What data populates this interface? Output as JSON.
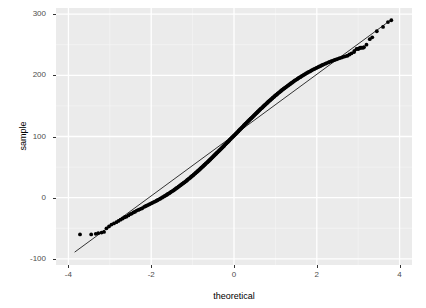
{
  "axes": {
    "x_title": "theoretical",
    "y_title": "sample",
    "x_ticks": [
      {
        "label": "-4",
        "value": -4
      },
      {
        "label": "-2",
        "value": -2
      },
      {
        "label": "0",
        "value": 0
      },
      {
        "label": "2",
        "value": 2
      },
      {
        "label": "4",
        "value": 4
      }
    ],
    "y_ticks": [
      {
        "label": "-100",
        "value": -100
      },
      {
        "label": "0",
        "value": 0
      },
      {
        "label": "100",
        "value": 100
      },
      {
        "label": "200",
        "value": 200
      },
      {
        "label": "300",
        "value": 300
      }
    ]
  },
  "style": {
    "panel_background": "#ebebeb",
    "grid_major": "#ffffff",
    "grid_minor": "#f5f5f5",
    "point_color": "#000000",
    "line_color": "#333333",
    "tick_text_color": "#4d4d4d",
    "title_color": "#000000"
  },
  "chart_data": {
    "type": "scatter",
    "title": "",
    "subtitle": "",
    "xlabel": "theoretical",
    "ylabel": "sample",
    "xlim": [
      -4.3,
      4.3
    ],
    "ylim": [
      -110,
      310
    ],
    "grid": true,
    "legend": false,
    "legend_position": "none",
    "xticks": [
      -4,
      -2,
      0,
      2,
      4
    ],
    "yticks": [
      -100,
      0,
      100,
      200,
      300
    ],
    "x_minor_ticks": [
      -3,
      -1,
      1,
      3
    ],
    "y_minor_ticks": [
      -50,
      50,
      150,
      250
    ],
    "reference_line": {
      "name": "qq-reference-line",
      "x0": -3.85,
      "y0": -89,
      "x1": 3.82,
      "y1": 292,
      "slope": 49.7,
      "intercept": 102.3
    },
    "series": [
      {
        "name": "sample quantiles",
        "marker": "filled-circle",
        "color": "#000000",
        "points": [
          [
            -3.72,
            -60
          ],
          [
            -3.45,
            -60
          ],
          [
            -3.34,
            -59
          ],
          [
            -3.28,
            -58
          ],
          [
            -3.2,
            -57
          ],
          [
            -3.14,
            -56
          ],
          [
            -3.08,
            -50
          ],
          [
            -3.02,
            -47
          ],
          [
            -2.96,
            -44
          ],
          [
            -2.9,
            -42
          ],
          [
            -2.84,
            -40
          ],
          [
            -2.79,
            -38
          ],
          [
            -2.74,
            -36
          ],
          [
            -2.69,
            -34
          ],
          [
            -2.64,
            -32
          ],
          [
            -2.6,
            -31
          ],
          [
            -2.55,
            -29
          ],
          [
            -2.51,
            -27
          ],
          [
            -2.47,
            -26
          ],
          [
            -2.43,
            -24
          ],
          [
            -2.39,
            -23
          ],
          [
            -2.35,
            -21
          ],
          [
            -2.31,
            -20
          ],
          [
            -2.28,
            -19
          ],
          [
            -2.24,
            -18
          ],
          [
            -2.21,
            -17
          ],
          [
            -2.17,
            -15
          ],
          [
            -2.14,
            -14
          ],
          [
            -2.11,
            -13
          ],
          [
            -2.08,
            -12
          ],
          [
            -2.05,
            -11
          ],
          [
            -2.02,
            -10
          ],
          [
            -1.99,
            -9
          ],
          [
            -1.96,
            -8
          ],
          [
            -1.93,
            -7
          ],
          [
            -1.9,
            -6
          ],
          [
            -1.87,
            -5
          ],
          [
            -1.85,
            -4
          ],
          [
            -1.82,
            -3
          ],
          [
            -1.79,
            -2
          ],
          [
            -1.77,
            -1
          ],
          [
            -1.74,
            0
          ],
          [
            -1.72,
            1
          ],
          [
            -1.69,
            2
          ],
          [
            -1.67,
            3
          ],
          [
            -1.64,
            4
          ],
          [
            -1.62,
            5
          ],
          [
            -1.6,
            6
          ],
          [
            -1.57,
            7
          ],
          [
            -1.55,
            8
          ],
          [
            -1.53,
            9
          ],
          [
            -1.51,
            10
          ],
          [
            -1.48,
            11
          ],
          [
            -1.46,
            12
          ],
          [
            -1.44,
            13
          ],
          [
            -1.42,
            14
          ],
          [
            -1.4,
            15
          ],
          [
            -1.38,
            16
          ],
          [
            -1.36,
            17
          ],
          [
            -1.34,
            18
          ],
          [
            -1.32,
            19
          ],
          [
            -1.3,
            20
          ],
          [
            -1.28,
            21
          ],
          [
            -1.26,
            22
          ],
          [
            -1.24,
            23
          ],
          [
            -1.22,
            24
          ],
          [
            -1.2,
            25
          ],
          [
            -1.18,
            26
          ],
          [
            -1.16,
            27
          ],
          [
            -1.14,
            28
          ],
          [
            -1.13,
            29
          ],
          [
            -1.11,
            30
          ],
          [
            -1.09,
            31
          ],
          [
            -1.07,
            32
          ],
          [
            -1.05,
            33
          ],
          [
            -1.04,
            34
          ],
          [
            -1.02,
            35
          ],
          [
            -1.0,
            36
          ],
          [
            -0.98,
            37
          ],
          [
            -0.97,
            38
          ],
          [
            -0.95,
            39
          ],
          [
            -0.93,
            40
          ],
          [
            -0.92,
            41
          ],
          [
            -0.9,
            42
          ],
          [
            -0.88,
            43
          ],
          [
            -0.87,
            44
          ],
          [
            -0.85,
            45
          ],
          [
            -0.83,
            46
          ],
          [
            -0.82,
            47
          ],
          [
            -0.8,
            48
          ],
          [
            -0.79,
            49
          ],
          [
            -0.77,
            50
          ],
          [
            -0.75,
            51
          ],
          [
            -0.74,
            52
          ],
          [
            -0.72,
            53
          ],
          [
            -0.71,
            54
          ],
          [
            -0.69,
            55
          ],
          [
            -0.68,
            56
          ],
          [
            -0.66,
            57
          ],
          [
            -0.64,
            58
          ],
          [
            -0.63,
            59
          ],
          [
            -0.61,
            60
          ],
          [
            -0.6,
            61
          ],
          [
            -0.58,
            62
          ],
          [
            -0.57,
            63
          ],
          [
            -0.55,
            64
          ],
          [
            -0.54,
            65
          ],
          [
            -0.52,
            66
          ],
          [
            -0.51,
            67
          ],
          [
            -0.49,
            68
          ],
          [
            -0.48,
            69
          ],
          [
            -0.46,
            70
          ],
          [
            -0.45,
            71
          ],
          [
            -0.43,
            72
          ],
          [
            -0.42,
            73
          ],
          [
            -0.4,
            74
          ],
          [
            -0.39,
            75
          ],
          [
            -0.37,
            76
          ],
          [
            -0.36,
            77
          ],
          [
            -0.34,
            78
          ],
          [
            -0.33,
            79
          ],
          [
            -0.31,
            80
          ],
          [
            -0.3,
            81
          ],
          [
            -0.28,
            82
          ],
          [
            -0.27,
            83
          ],
          [
            -0.25,
            84
          ],
          [
            -0.24,
            85
          ],
          [
            -0.23,
            86
          ],
          [
            -0.21,
            87
          ],
          [
            -0.2,
            88
          ],
          [
            -0.18,
            89
          ],
          [
            -0.17,
            90
          ],
          [
            -0.15,
            91
          ],
          [
            -0.14,
            92
          ],
          [
            -0.12,
            93
          ],
          [
            -0.11,
            94
          ],
          [
            -0.1,
            95
          ],
          [
            -0.08,
            96
          ],
          [
            -0.07,
            97
          ],
          [
            -0.05,
            98
          ],
          [
            -0.04,
            99
          ],
          [
            -0.02,
            100
          ],
          [
            -0.01,
            101
          ],
          [
            0.01,
            102
          ],
          [
            0.02,
            103
          ],
          [
            0.04,
            104
          ],
          [
            0.05,
            105
          ],
          [
            0.07,
            106
          ],
          [
            0.08,
            107
          ],
          [
            0.1,
            108
          ],
          [
            0.11,
            109
          ],
          [
            0.12,
            110
          ],
          [
            0.14,
            111
          ],
          [
            0.15,
            112
          ],
          [
            0.17,
            113
          ],
          [
            0.18,
            114
          ],
          [
            0.2,
            115
          ],
          [
            0.21,
            116
          ],
          [
            0.23,
            117
          ],
          [
            0.24,
            118
          ],
          [
            0.25,
            119
          ],
          [
            0.27,
            120
          ],
          [
            0.28,
            121
          ],
          [
            0.3,
            122
          ],
          [
            0.31,
            123
          ],
          [
            0.33,
            124
          ],
          [
            0.34,
            125
          ],
          [
            0.36,
            126
          ],
          [
            0.37,
            127
          ],
          [
            0.39,
            128
          ],
          [
            0.4,
            129
          ],
          [
            0.42,
            130
          ],
          [
            0.43,
            131
          ],
          [
            0.45,
            132
          ],
          [
            0.46,
            133
          ],
          [
            0.48,
            134
          ],
          [
            0.49,
            135
          ],
          [
            0.51,
            136
          ],
          [
            0.52,
            137
          ],
          [
            0.54,
            138
          ],
          [
            0.55,
            139
          ],
          [
            0.57,
            140
          ],
          [
            0.58,
            141
          ],
          [
            0.6,
            142
          ],
          [
            0.61,
            143
          ],
          [
            0.63,
            144
          ],
          [
            0.64,
            145
          ],
          [
            0.66,
            146
          ],
          [
            0.68,
            147
          ],
          [
            0.69,
            148
          ],
          [
            0.71,
            149
          ],
          [
            0.72,
            150
          ],
          [
            0.74,
            151
          ],
          [
            0.75,
            152
          ],
          [
            0.77,
            153
          ],
          [
            0.79,
            154
          ],
          [
            0.8,
            155
          ],
          [
            0.82,
            156
          ],
          [
            0.83,
            157
          ],
          [
            0.85,
            158
          ],
          [
            0.87,
            159
          ],
          [
            0.88,
            160
          ],
          [
            0.9,
            161
          ],
          [
            0.92,
            162
          ],
          [
            0.93,
            163
          ],
          [
            0.95,
            164
          ],
          [
            0.97,
            165
          ],
          [
            0.98,
            166
          ],
          [
            1.0,
            167
          ],
          [
            1.02,
            168
          ],
          [
            1.04,
            169
          ],
          [
            1.05,
            170
          ],
          [
            1.07,
            171
          ],
          [
            1.09,
            172
          ],
          [
            1.11,
            173
          ],
          [
            1.13,
            174
          ],
          [
            1.14,
            175
          ],
          [
            1.16,
            176
          ],
          [
            1.18,
            177
          ],
          [
            1.2,
            178
          ],
          [
            1.22,
            179
          ],
          [
            1.24,
            180
          ],
          [
            1.26,
            181
          ],
          [
            1.28,
            182
          ],
          [
            1.3,
            183
          ],
          [
            1.32,
            184
          ],
          [
            1.34,
            185
          ],
          [
            1.36,
            186
          ],
          [
            1.38,
            187
          ],
          [
            1.4,
            188
          ],
          [
            1.42,
            189
          ],
          [
            1.44,
            190
          ],
          [
            1.46,
            191
          ],
          [
            1.48,
            192
          ],
          [
            1.51,
            193
          ],
          [
            1.53,
            194
          ],
          [
            1.55,
            195
          ],
          [
            1.57,
            196
          ],
          [
            1.6,
            197
          ],
          [
            1.62,
            198
          ],
          [
            1.64,
            199
          ],
          [
            1.67,
            200
          ],
          [
            1.69,
            201
          ],
          [
            1.72,
            202
          ],
          [
            1.74,
            203
          ],
          [
            1.77,
            204
          ],
          [
            1.79,
            205
          ],
          [
            1.82,
            206
          ],
          [
            1.85,
            207
          ],
          [
            1.87,
            208
          ],
          [
            1.9,
            209
          ],
          [
            1.93,
            210
          ],
          [
            1.96,
            211
          ],
          [
            1.99,
            212
          ],
          [
            2.02,
            213
          ],
          [
            2.05,
            214
          ],
          [
            2.08,
            215
          ],
          [
            2.11,
            216
          ],
          [
            2.14,
            217
          ],
          [
            2.17,
            218
          ],
          [
            2.21,
            219
          ],
          [
            2.24,
            220
          ],
          [
            2.28,
            221
          ],
          [
            2.31,
            222
          ],
          [
            2.35,
            223
          ],
          [
            2.39,
            224
          ],
          [
            2.43,
            225
          ],
          [
            2.47,
            226
          ],
          [
            2.51,
            227
          ],
          [
            2.55,
            228
          ],
          [
            2.6,
            229
          ],
          [
            2.64,
            230
          ],
          [
            2.69,
            231
          ],
          [
            2.74,
            232
          ],
          [
            2.79,
            234
          ],
          [
            2.84,
            236
          ],
          [
            2.9,
            238
          ],
          [
            2.91,
            240
          ],
          [
            2.96,
            243
          ],
          [
            3.0,
            243
          ],
          [
            3.02,
            244
          ],
          [
            3.05,
            245
          ],
          [
            3.08,
            245
          ],
          [
            3.12,
            245
          ],
          [
            3.14,
            246
          ],
          [
            3.2,
            250
          ],
          [
            3.28,
            259
          ],
          [
            3.34,
            262
          ],
          [
            3.45,
            272
          ],
          [
            3.6,
            279
          ],
          [
            3.72,
            287
          ],
          [
            3.8,
            290
          ]
        ]
      }
    ]
  }
}
